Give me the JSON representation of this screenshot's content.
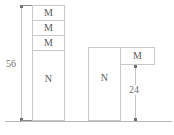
{
  "diagram": {
    "background_color": "#ffffff",
    "line_color": "#c8c8c8",
    "text_color": "#5a5a5a",
    "baseline": {
      "name": "ground-line",
      "y": 121,
      "x_start": 5,
      "x_end": 172
    },
    "left_group": {
      "name": "left-bar-stack",
      "total_dimension_label": "56",
      "segments": [
        {
          "label": "M",
          "order": 1
        },
        {
          "label": "M",
          "order": 2
        },
        {
          "label": "M",
          "order": 3
        },
        {
          "label": "N",
          "order": 4
        }
      ]
    },
    "right_group": {
      "name": "right-bar-group",
      "base_label": "N",
      "side_label": "M",
      "dimension_label": "24"
    },
    "dimensions": [
      {
        "name": "left-total-height",
        "value": "56",
        "orientation": "vertical"
      },
      {
        "name": "right-offset-height",
        "value": "24",
        "orientation": "vertical"
      }
    ]
  }
}
